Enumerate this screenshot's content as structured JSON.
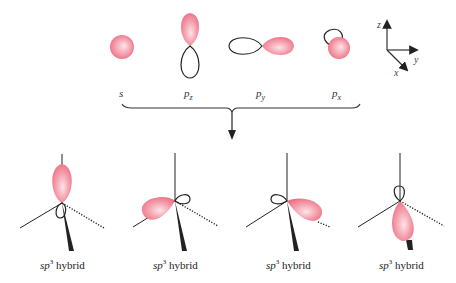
{
  "diagram": {
    "colors": {
      "lobe_fill": "#f07a8c",
      "lobe_highlight": "#fde4e8",
      "line": "#222222"
    },
    "atomic_orbitals": [
      {
        "id": "s",
        "symbol": "s",
        "sub": ""
      },
      {
        "id": "pz",
        "symbol": "p",
        "sub": "z"
      },
      {
        "id": "py",
        "symbol": "p",
        "sub": "y"
      },
      {
        "id": "px",
        "symbol": "p",
        "sub": "x"
      }
    ],
    "axes": {
      "z": "z",
      "y": "y",
      "x": "x"
    },
    "hybrids": [
      {
        "prefix": "sp",
        "sup": "3",
        "suffix": " hybrid"
      },
      {
        "prefix": "sp",
        "sup": "3",
        "suffix": " hybrid"
      },
      {
        "prefix": "sp",
        "sup": "3",
        "suffix": " hybrid"
      },
      {
        "prefix": "sp",
        "sup": "3",
        "suffix": " hybrid"
      }
    ]
  }
}
